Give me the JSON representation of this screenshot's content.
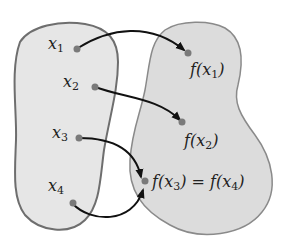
{
  "diagram": {
    "type": "function-mapping",
    "colors": {
      "domain_fill": "#e6e6e6",
      "codomain_fill": "#dcdcdc",
      "outline": "#6e6e6e",
      "point": "#7a7a7a",
      "arrow": "#111111"
    },
    "domain_points": [
      {
        "var": "x",
        "sub": "1"
      },
      {
        "var": "x",
        "sub": "2"
      },
      {
        "var": "x",
        "sub": "3"
      },
      {
        "var": "x",
        "sub": "4"
      }
    ],
    "codomain_points": [
      {
        "text_pre": "f(x",
        "sub": "1",
        "text_post": ")"
      },
      {
        "text_pre": "f(x",
        "sub": "2",
        "text_post": ")"
      },
      {
        "text_pre": "f(x",
        "sub": "3",
        "text_mid": ") = f(x",
        "sub2": "4",
        "text_post": ")"
      }
    ],
    "mappings": [
      {
        "from": "x1",
        "to": "f(x1)"
      },
      {
        "from": "x2",
        "to": "f(x2)"
      },
      {
        "from": "x3",
        "to": "f(x3)=f(x4)"
      },
      {
        "from": "x4",
        "to": "f(x3)=f(x4)"
      }
    ]
  }
}
